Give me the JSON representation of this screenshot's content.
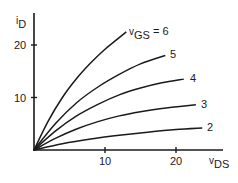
{
  "chart_data": {
    "type": "line",
    "title": "",
    "xlabel": "v_DS",
    "ylabel": "i_D",
    "xlabel_main": "v",
    "xlabel_sub": "DS",
    "ylabel_main": "i",
    "ylabel_sub": "D",
    "xlim": [
      0,
      26
    ],
    "ylim": [
      0,
      26
    ],
    "xticks": [
      10,
      20
    ],
    "yticks": [
      10,
      20
    ],
    "xtick_labels": [
      "10",
      "20"
    ],
    "ytick_labels": [
      "10",
      "20"
    ],
    "grid": false,
    "legend": "inline curve labels at right end of each curve",
    "parameter_name": "v_GS",
    "series": [
      {
        "name": "v_GS = 6",
        "label": "6",
        "x": [
          0,
          2,
          4,
          6,
          8,
          10,
          13
        ],
        "y": [
          0,
          5.5,
          10,
          13.6,
          16.6,
          19.2,
          22.5
        ]
      },
      {
        "name": "v_GS = 5",
        "label": "5",
        "x": [
          0,
          3,
          6,
          9,
          12,
          15,
          18.5
        ],
        "y": [
          0,
          5,
          9,
          12,
          14.4,
          16.4,
          18
        ]
      },
      {
        "name": "v_GS = 4",
        "label": "4",
        "x": [
          0,
          3,
          6,
          9,
          12,
          15,
          18,
          21.1
        ],
        "y": [
          0,
          3.6,
          6.5,
          8.7,
          10.5,
          11.8,
          12.8,
          13.5
        ]
      },
      {
        "name": "v_GS = 3",
        "label": "3",
        "x": [
          0,
          3,
          6,
          9,
          12,
          15,
          18,
          22.8
        ],
        "y": [
          0,
          2.2,
          4,
          5.4,
          6.5,
          7.3,
          7.9,
          8.6
        ]
      },
      {
        "name": "v_GS = 2",
        "label": "2",
        "x": [
          0,
          4,
          8,
          12,
          16,
          20,
          23.7
        ],
        "y": [
          0,
          1.2,
          2.1,
          2.8,
          3.4,
          3.9,
          4.2
        ]
      }
    ],
    "annotations": [
      "v_GS = 6",
      "5",
      "4",
      "3",
      "2"
    ]
  },
  "labels": {
    "curve_top_prefix_main": "v",
    "curve_top_prefix_sub": "GS",
    "curve_top_suffix": " = 6"
  }
}
